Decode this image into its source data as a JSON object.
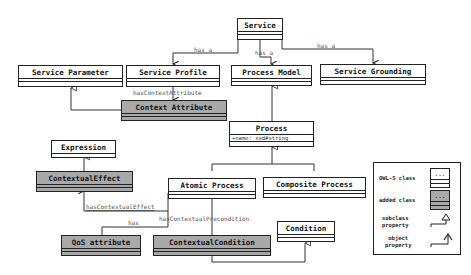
{
  "diagram": {
    "type": "UML class diagram",
    "classes": [
      {
        "id": "service",
        "label": "Service",
        "kind": "owl-s"
      },
      {
        "id": "service-parameter",
        "label": "Service Parameter",
        "kind": "owl-s"
      },
      {
        "id": "service-profile",
        "label": "Service Profile",
        "kind": "owl-s"
      },
      {
        "id": "process-model",
        "label": "Process Model",
        "kind": "owl-s"
      },
      {
        "id": "service-grounding",
        "label": "Service Grounding",
        "kind": "owl-s"
      },
      {
        "id": "context-attribute",
        "label": "Context Attribute",
        "kind": "added"
      },
      {
        "id": "process",
        "label": "Process",
        "kind": "owl-s",
        "attribute": "+name: xsd#string"
      },
      {
        "id": "expression",
        "label": "Expression",
        "kind": "owl-s"
      },
      {
        "id": "contextual-effect",
        "label": "ContextualEffect",
        "kind": "added"
      },
      {
        "id": "atomic-process",
        "label": "Atomic Process",
        "kind": "owl-s"
      },
      {
        "id": "composite-process",
        "label": "Composite Process",
        "kind": "owl-s"
      },
      {
        "id": "condition",
        "label": "Condition",
        "kind": "owl-s"
      },
      {
        "id": "qos-attribute",
        "label": "QoS attribute",
        "kind": "added"
      },
      {
        "id": "contextual-condition",
        "label": "ContextualCondition",
        "kind": "added"
      }
    ],
    "edges": [
      {
        "from": "service",
        "to": "service-profile",
        "type": "object",
        "label": "has a"
      },
      {
        "from": "service",
        "to": "process-model",
        "type": "object",
        "label": "has a"
      },
      {
        "from": "service",
        "to": "service-grounding",
        "type": "object",
        "label": "has a"
      },
      {
        "from": "service-profile",
        "to": "context-attribute",
        "type": "object",
        "label": "hasContextAttribute"
      },
      {
        "from": "context-attribute",
        "to": "service-parameter",
        "type": "subclass"
      },
      {
        "from": "process",
        "to": "process-model",
        "type": "subclass"
      },
      {
        "from": "atomic-process",
        "to": "process",
        "type": "subclass"
      },
      {
        "from": "composite-process",
        "to": "process",
        "type": "subclass"
      },
      {
        "from": "contextual-effect",
        "to": "expression",
        "type": "subclass"
      },
      {
        "from": "atomic-process",
        "to": "contextual-effect",
        "type": "object",
        "label": "hasContextualEffect"
      },
      {
        "from": "atomic-process",
        "to": "qos-attribute",
        "type": "object",
        "label": "has"
      },
      {
        "from": "atomic-process",
        "to": "contextual-condition",
        "type": "object",
        "label": "hasContextualPrecondition"
      },
      {
        "from": "contextual-condition",
        "to": "condition",
        "type": "subclass"
      }
    ],
    "labels": {
      "has_a_1": "has a",
      "has_a_2": "has a",
      "has_a_3": "has a",
      "has_context_attribute": "hasContextAttribute",
      "has_contextual_effect": "hasContextualEffect",
      "has": "has",
      "has_contextual_precondition": "hasContextualPrecondition"
    },
    "legend": {
      "owl_s_class": "OWL-S class",
      "added_class": "added class",
      "subclass_property": "subclass\nproperty",
      "object_property": "object\nproperty",
      "box_placeholder": "...",
      "colors": {
        "owl_s": "#ffffff",
        "added": "#a9a9a9",
        "line": "#222222"
      }
    }
  }
}
